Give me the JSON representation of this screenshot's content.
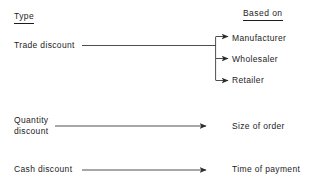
{
  "diagram": {
    "title_left": "Type",
    "title_right": "Based on",
    "rows": [
      {
        "id": "trade",
        "type_label": "Trade discount",
        "connector": "branch",
        "targets": [
          "Manufacturer",
          "Wholesaler",
          "Retailer"
        ]
      },
      {
        "id": "quantity",
        "type_label": "Quantity\ndiscount",
        "connector": "arrow",
        "targets": [
          "Size of order"
        ]
      },
      {
        "id": "cash",
        "type_label": "Cash discount",
        "connector": "arrow",
        "targets": [
          "Time of payment"
        ]
      }
    ],
    "colors": {
      "ink": "#1c1c1c",
      "background": "#ffffff",
      "line": "#3a3a3a"
    }
  }
}
